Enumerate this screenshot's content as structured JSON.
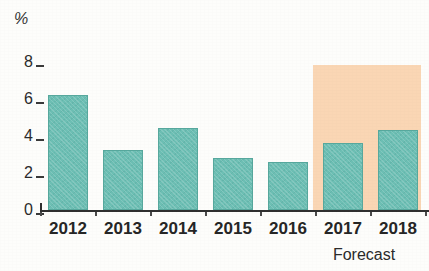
{
  "chart_data": {
    "type": "bar",
    "title": "",
    "subtitle": "",
    "xlabel": "",
    "ylabel": "%",
    "unit_label": "%",
    "categories": [
      "2012",
      "2013",
      "2014",
      "2015",
      "2016",
      "2017",
      "2018"
    ],
    "values": [
      6.2,
      3.25,
      4.45,
      2.8,
      2.6,
      3.6,
      4.35
    ],
    "series": [
      {
        "name": "",
        "values": [
          6.2,
          3.25,
          4.45,
          2.8,
          2.6,
          3.6,
          4.35
        ]
      }
    ],
    "ylim": [
      0,
      8.5
    ],
    "yticks": [
      "8",
      "6",
      "4",
      "2",
      "0"
    ],
    "ytick_values": [
      8,
      6,
      4,
      2,
      0
    ],
    "grid": false,
    "legend": "none",
    "annotations": [
      {
        "text": "Forecast",
        "covers": [
          "2017",
          "2018"
        ],
        "position": "below-axis-right"
      }
    ],
    "forecast_region": {
      "label": "Forecast",
      "start_category": "2017",
      "end_category": "2018",
      "color": "#fad6b4"
    },
    "colors": {
      "bar": "#6dbfb4",
      "bar_border": "#57a89d",
      "forecast_shade": "#fad6b4",
      "axis": "#2f2f2f",
      "text": "#262626",
      "background": "#fdfdfb"
    }
  },
  "axis": {
    "unit": "%"
  },
  "footer": {
    "forecast_label": "Forecast"
  }
}
